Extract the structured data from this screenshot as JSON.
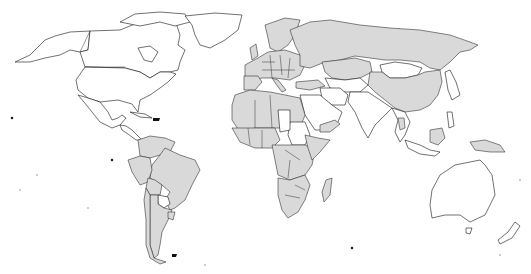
{
  "map": {
    "type": "world-choropleth",
    "projection": "equirectangular-like",
    "legend": null,
    "title": null,
    "colors": {
      "shaded": "#d9d9d9",
      "unshaded": "#ffffff",
      "outline": "#111111",
      "background": "#ffffff"
    },
    "shaded_regions": [
      "Europe",
      "Russia",
      "China",
      "Kazakhstan",
      "Turkey",
      "Iran",
      "North Africa",
      "West Africa",
      "Central Africa",
      "Southern Africa",
      "East Africa",
      "Madagascar",
      "Brazil",
      "Argentina",
      "Chile",
      "Peru",
      "Colombia",
      "Venezuela",
      "Bolivia",
      "Papua New Guinea",
      "Borneo (Malaysia)",
      "Thailand",
      "Greenland-coast-none"
    ],
    "unshaded_regions": [
      "Canada",
      "United States",
      "Mexico",
      "Greenland",
      "Alaska",
      "Mongolia",
      "Japan",
      "Korea",
      "India",
      "Pakistan",
      "Afghanistan",
      "Saudi Arabia",
      "Sudan",
      "Libya-partial",
      "Paraguay",
      "Australia",
      "New Zealand",
      "Indonesia-partial",
      "Philippines"
    ]
  }
}
